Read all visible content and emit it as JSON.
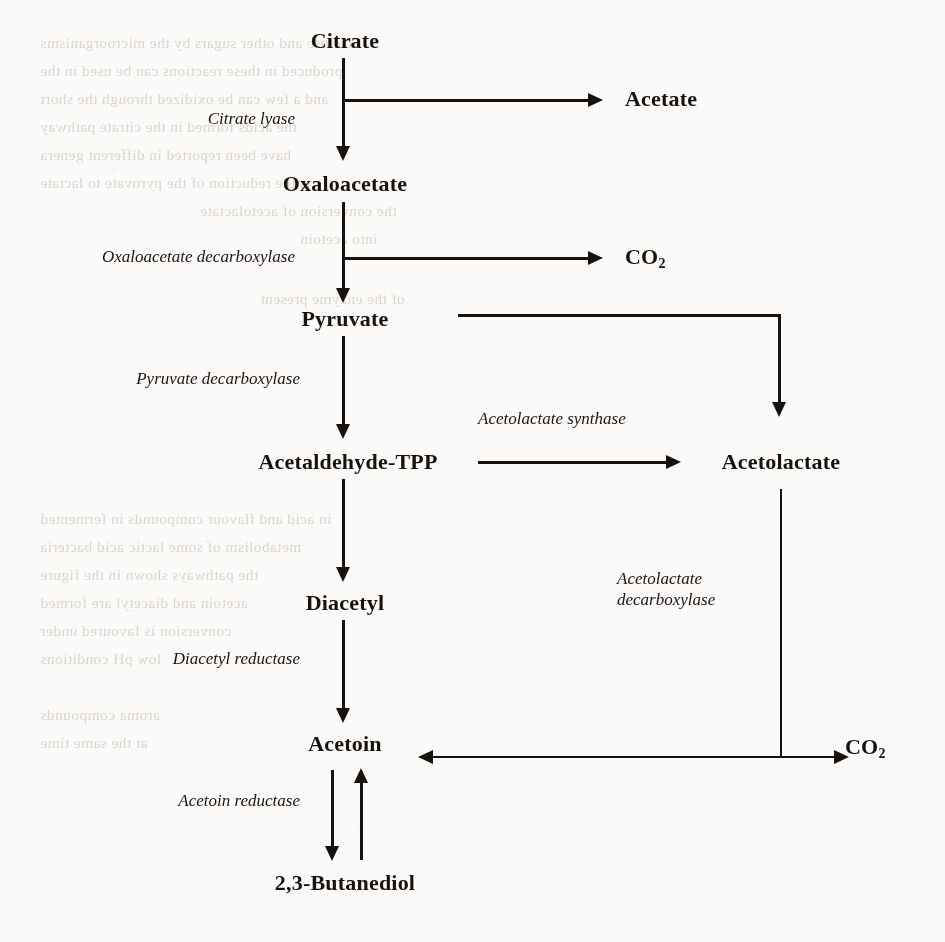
{
  "diagram": {
    "ink_color": "#16120f",
    "background_color": "#fbfaf8",
    "species": [
      {
        "id": "citrate",
        "label": "Citrate",
        "x": 345,
        "y": 42
      },
      {
        "id": "acetate",
        "label": "Acetate",
        "x": 625,
        "y": 100
      },
      {
        "id": "oxaloacetate",
        "label": "Oxaloacetate",
        "x": 345,
        "y": 185
      },
      {
        "id": "co2-top",
        "label": "CO",
        "sub": "2",
        "x": 625,
        "y": 258
      },
      {
        "id": "pyruvate",
        "label": "Pyruvate",
        "x": 345,
        "y": 320
      },
      {
        "id": "acetaldehyde-tpp",
        "label": "Acetaldehyde-TPP",
        "x": 348,
        "y": 463
      },
      {
        "id": "acetolactate",
        "label": "Acetolactate",
        "x": 781,
        "y": 463
      },
      {
        "id": "diacetyl",
        "label": "Diacetyl",
        "x": 345,
        "y": 604
      },
      {
        "id": "acetoin",
        "label": "Acetoin",
        "x": 345,
        "y": 745
      },
      {
        "id": "co2-bottom",
        "label": "CO",
        "sub": "2",
        "x": 866,
        "y": 748
      },
      {
        "id": "butanediol",
        "label": "2,3-Butanediol",
        "x": 345,
        "y": 884
      }
    ],
    "enzymes": [
      {
        "id": "citrate-lyase",
        "label": "Citrate lyase",
        "x": 295,
        "y": 118
      },
      {
        "id": "oxaloacetate-decarboxylase",
        "label": "Oxaloacetate decarboxylase",
        "x": 295,
        "y": 256
      },
      {
        "id": "pyruvate-decarboxylase",
        "label": "Pyruvate decarboxylase",
        "x": 300,
        "y": 378
      },
      {
        "id": "acetolactate-synthase",
        "label": "Acetolactate synthase",
        "x": 478,
        "y": 418
      },
      {
        "id": "acetolactate-decarboxylase",
        "label": "Acetolactate decarboxylase",
        "line1": "Acetolactate",
        "line2": "decarboxylase",
        "x": 617,
        "y": 578
      },
      {
        "id": "diacetyl-reductase",
        "label": "Diacetyl reductase",
        "x": 300,
        "y": 658
      },
      {
        "id": "acetoin-reductase",
        "label": "Acetoin reductase",
        "x": 300,
        "y": 800
      }
    ],
    "reactions": [
      {
        "id": "citrate-to-oxaloacetate",
        "from": "citrate",
        "to": "oxaloacetate",
        "enzyme": "citrate-lyase",
        "direction": "down"
      },
      {
        "id": "citrate-to-acetate",
        "from": "citrate",
        "to": "acetate",
        "enzyme": "citrate-lyase",
        "direction": "right"
      },
      {
        "id": "oxaloacetate-to-pyruvate",
        "from": "oxaloacetate",
        "to": "pyruvate",
        "enzyme": "oxaloacetate-decarboxylase",
        "direction": "down"
      },
      {
        "id": "oxaloacetate-to-co2",
        "from": "oxaloacetate",
        "to": "co2-top",
        "enzyme": "oxaloacetate-decarboxylase",
        "direction": "right"
      },
      {
        "id": "pyruvate-to-acetaldehyde-tpp",
        "from": "pyruvate",
        "to": "acetaldehyde-tpp",
        "enzyme": "pyruvate-decarboxylase",
        "direction": "down"
      },
      {
        "id": "pyruvate-to-acetolactate",
        "from": "pyruvate",
        "to": "acetolactate",
        "enzyme": "acetolactate-synthase",
        "direction": "right-down"
      },
      {
        "id": "acetaldehyde-tpp-to-acetolactate",
        "from": "acetaldehyde-tpp",
        "to": "acetolactate",
        "enzyme": "acetolactate-synthase",
        "direction": "right"
      },
      {
        "id": "acetaldehyde-tpp-to-diacetyl",
        "from": "acetaldehyde-tpp",
        "to": "diacetyl",
        "enzyme": "",
        "direction": "down"
      },
      {
        "id": "diacetyl-to-acetoin",
        "from": "diacetyl",
        "to": "acetoin",
        "enzyme": "diacetyl-reductase",
        "direction": "down"
      },
      {
        "id": "acetolactate-to-acetoin",
        "from": "acetolactate",
        "to": "acetoin",
        "enzyme": "acetolactate-decarboxylase",
        "direction": "down-left"
      },
      {
        "id": "acetolactate-to-co2",
        "from": "acetolactate",
        "to": "co2-bottom",
        "enzyme": "acetolactate-decarboxylase",
        "direction": "down-right"
      },
      {
        "id": "acetoin-butanediol-reversible",
        "from": "acetoin",
        "to": "butanediol",
        "enzyme": "acetoin-reductase",
        "direction": "reversible"
      }
    ]
  },
  "background_text": {
    "note": "faint show-through text from the reverse side of the scanned page",
    "lines": [
      {
        "text": "lactose and other sugars by the microorganisms",
        "x": 40,
        "y": 34
      },
      {
        "text": "produced in these reactions can be used in the",
        "x": 40,
        "y": 62
      },
      {
        "text": "and a few can be oxidized through the short",
        "x": 40,
        "y": 90
      },
      {
        "text": "the acids formed in the citrate pathway",
        "x": 40,
        "y": 118
      },
      {
        "text": "have been reported in different genera",
        "x": 40,
        "y": 146
      },
      {
        "text": "is the reduction of the pyruvate to lactate",
        "x": 40,
        "y": 174
      },
      {
        "text": "the conversion of acetolactate",
        "x": 200,
        "y": 202
      },
      {
        "text": "into acetoin",
        "x": 300,
        "y": 230
      },
      {
        "text": "of the enzyme present",
        "x": 260,
        "y": 290
      },
      {
        "text": "in acid and flavour compounds in fermented",
        "x": 40,
        "y": 510
      },
      {
        "text": "metabolism of some lactic acid bacteria",
        "x": 40,
        "y": 538
      },
      {
        "text": "the pathways shown in the figure",
        "x": 40,
        "y": 566
      },
      {
        "text": "acetoin and diacetyl are formed",
        "x": 40,
        "y": 594
      },
      {
        "text": "conversion is favoured under",
        "x": 40,
        "y": 622
      },
      {
        "text": "low pH conditions",
        "x": 40,
        "y": 650
      },
      {
        "text": "aroma compounds",
        "x": 40,
        "y": 706
      },
      {
        "text": "at the same time",
        "x": 40,
        "y": 734
      }
    ]
  }
}
